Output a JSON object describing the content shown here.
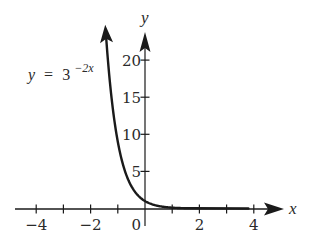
{
  "chart_data": {
    "type": "line",
    "title": "",
    "function": "y = 3^(-2x)",
    "equation_label": {
      "lhs": "y",
      "equals": "=",
      "base": "3",
      "exponent": "−2x"
    },
    "xlabel": "x",
    "ylabel": "y",
    "xlim": [
      -4.2,
      5.1
    ],
    "ylim": [
      -1,
      24
    ],
    "x_ticks": [
      -4,
      -3,
      -2,
      -1,
      0,
      1,
      2,
      3,
      4
    ],
    "x_tick_labels": [
      {
        "value": -4,
        "label": "−4"
      },
      {
        "value": -2,
        "label": "−2"
      },
      {
        "value": 0,
        "label": "0"
      },
      {
        "value": 2,
        "label": "2"
      },
      {
        "value": 4,
        "label": "4"
      }
    ],
    "y_ticks": [
      5,
      10,
      15,
      20
    ],
    "y_tick_labels": [
      {
        "value": 5,
        "label": "5"
      },
      {
        "value": 10,
        "label": "10"
      },
      {
        "value": 15,
        "label": "15"
      },
      {
        "value": 20,
        "label": "20"
      }
    ],
    "grid": false,
    "legend": null,
    "series": [
      {
        "name": "y = 3^(-2x)",
        "x": [
          -1.43,
          -1.25,
          -1.0,
          -0.75,
          -0.5,
          -0.25,
          0,
          0.25,
          0.5,
          1.0,
          1.5,
          2.0,
          3.0,
          4.0
        ],
        "y": [
          23.2,
          15.6,
          9.0,
          5.2,
          3.0,
          1.73,
          1.0,
          0.58,
          0.33,
          0.11,
          0.04,
          0.01,
          0.0,
          0.0
        ]
      }
    ],
    "colors": {
      "ink": "#1a1a1a",
      "background": "#ffffff"
    }
  }
}
